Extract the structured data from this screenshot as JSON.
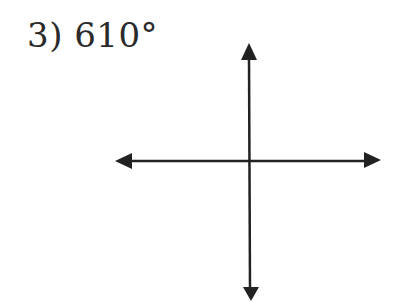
{
  "problem": {
    "number": "3)",
    "angle": "610°",
    "label": "3) 610°"
  },
  "axes": {
    "type": "cartesian-axes",
    "color": "#222222",
    "origin": [
      250,
      161
    ],
    "x_axis": {
      "from": 115,
      "to": 381,
      "arrows": [
        "left",
        "right"
      ]
    },
    "y_axis": {
      "from": 43,
      "to": 301,
      "arrows": [
        "up",
        "down"
      ]
    }
  }
}
